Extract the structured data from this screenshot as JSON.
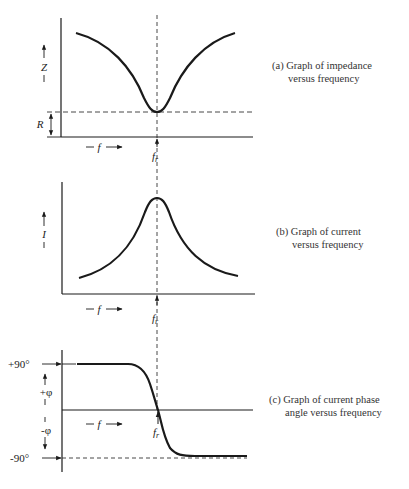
{
  "figure": {
    "panels": [
      {
        "id": "a",
        "caption_line1": "(a) Graph of impedance",
        "caption_line2": "versus frequency",
        "y_axis_label": "Z",
        "x_axis_label": "f",
        "reference_label": "R",
        "resonance_label": "f",
        "resonance_subscript": "r"
      },
      {
        "id": "b",
        "caption_line1": "(b) Graph of current",
        "caption_line2": "versus frequency",
        "y_axis_label": "I",
        "x_axis_label": "f",
        "resonance_label": "f",
        "resonance_subscript": "r"
      },
      {
        "id": "c",
        "caption_line1": "(c) Graph of current phase",
        "caption_line2": "angle versus frequency",
        "upper_tick_label": "+90°",
        "lower_tick_label": "-90°",
        "positive_phase_label": "+φ",
        "negative_phase_label": "-φ",
        "x_axis_label": "f",
        "resonance_label": "f",
        "resonance_subscript": "r"
      }
    ]
  },
  "colors": {
    "ink": "#1a1a1a",
    "background": "#ffffff"
  }
}
